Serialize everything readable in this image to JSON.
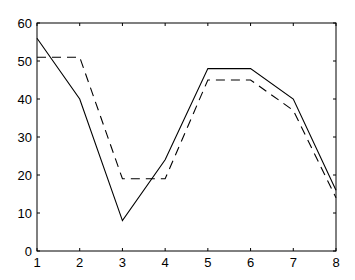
{
  "chart_data": {
    "type": "line",
    "title": "",
    "xlabel": "",
    "ylabel": "",
    "x": [
      1,
      2,
      3,
      4,
      5,
      6,
      7,
      8
    ],
    "xlim": [
      1,
      8
    ],
    "ylim": [
      0,
      60
    ],
    "xticks": [
      1,
      2,
      3,
      4,
      5,
      6,
      7,
      8
    ],
    "yticks": [
      0,
      10,
      20,
      30,
      40,
      50,
      60
    ],
    "grid": false,
    "series": [
      {
        "name": "solid",
        "style": "solid",
        "color": "#000000",
        "values": [
          56,
          40,
          8,
          24,
          48,
          48,
          40,
          16
        ]
      },
      {
        "name": "dashed",
        "style": "dashed",
        "color": "#000000",
        "x": [
          1,
          2,
          3,
          4,
          5,
          6,
          7,
          8
        ],
        "values": [
          51,
          51,
          19,
          19,
          45,
          45,
          37,
          14
        ]
      }
    ]
  }
}
